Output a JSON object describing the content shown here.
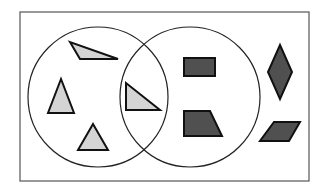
{
  "diagram": {
    "type": "venn",
    "universe": {
      "label": "",
      "x": 20,
      "y": 12,
      "width": 289,
      "height": 169
    },
    "sets": [
      {
        "name": "left-circle",
        "cx": 98,
        "cy": 97,
        "r": 70
      },
      {
        "name": "right-circle",
        "cx": 190,
        "cy": 97,
        "r": 70
      }
    ],
    "colors": {
      "border": "#555555",
      "circle_stroke": "#222222",
      "light_fill": "#d4d4d4",
      "dark_fill": "#505050",
      "shape_stroke": "#111111"
    },
    "shapes": [
      {
        "name": "triangle-top",
        "kind": "triangle",
        "region": "left-only",
        "fill": "light",
        "points": "70,42 80,59 118,59"
      },
      {
        "name": "triangle-left",
        "kind": "triangle",
        "region": "left-only",
        "fill": "light",
        "points": "61,79 48,113 74,113"
      },
      {
        "name": "triangle-bottom",
        "kind": "triangle",
        "region": "left-only",
        "fill": "light",
        "points": "93,124 78,150 108,150"
      },
      {
        "name": "triangle-intersection",
        "kind": "right-triangle",
        "region": "both",
        "fill": "light",
        "points": "126,83 126,110 160,110"
      },
      {
        "name": "rectangle",
        "kind": "rectangle",
        "region": "right-only",
        "fill": "dark",
        "points": "184,58 215,58 215,76 184,76"
      },
      {
        "name": "trapezoid",
        "kind": "trapezoid",
        "region": "right-only",
        "fill": "dark",
        "points": "184,111 210,111 222,136 184,136"
      },
      {
        "name": "rhombus",
        "kind": "rhombus",
        "region": "outside",
        "fill": "dark",
        "points": "280,45 292,72 280,99 268,72"
      },
      {
        "name": "parallelogram",
        "kind": "parallelogram",
        "region": "outside",
        "fill": "dark",
        "points": "274,122 300,122 289,141 260,141"
      }
    ]
  }
}
